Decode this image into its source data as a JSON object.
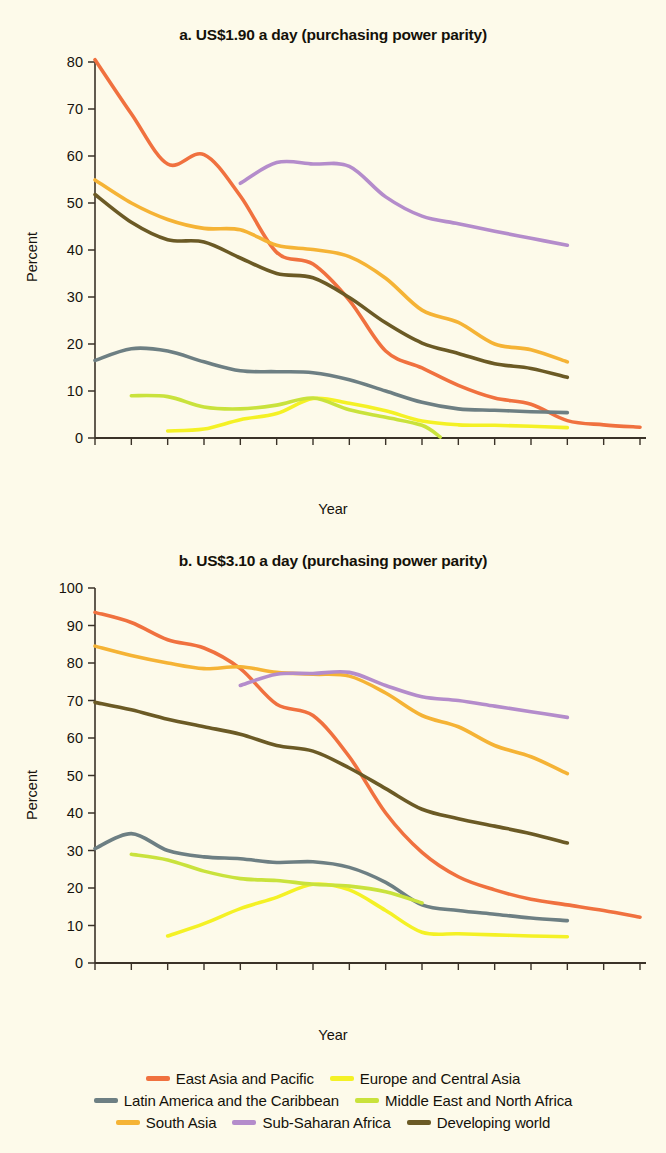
{
  "figure": {
    "background_color": "#fdfaea",
    "axis_color": "#3a3228",
    "xlabel": "Year",
    "ylabel": "Percent"
  },
  "legend": {
    "rows": [
      [
        {
          "label": "East Asia and Pacific",
          "color": "#f0713f"
        },
        {
          "label": "Europe and Central Asia",
          "color": "#f4f125"
        }
      ],
      [
        {
          "label": "Latin America and the Caribbean",
          "color": "#6d7f83"
        },
        {
          "label": "Middle East and North Africa",
          "color": "#c9e23c"
        }
      ],
      [
        {
          "label": "South Asia",
          "color": "#f5b335"
        },
        {
          "label": "Sub-Saharan Africa",
          "color": "#b48ccb"
        },
        {
          "label": "Developing world",
          "color": "#6b5a25"
        }
      ]
    ]
  },
  "chart_data": [
    {
      "id": "panel-a",
      "type": "line",
      "title": "a. US$1.90 a day (purchasing power parity)",
      "xlabel": "Year",
      "ylabel": "Percent",
      "ylim": [
        0,
        80
      ],
      "yticks": [
        0,
        10,
        20,
        30,
        40,
        50,
        60,
        70,
        80
      ],
      "grid": false,
      "legend_position": "below-figure",
      "categories": [
        "1981",
        "1984",
        "1987",
        "1990",
        "1993",
        "1996",
        "1999",
        "2002",
        "2005",
        "2008",
        "2010",
        "2011",
        "2012",
        "2013",
        "2014",
        "2015"
      ],
      "series": [
        {
          "name": "East Asia and Pacific",
          "color": "#f0713f",
          "x": [
            "1981",
            "1984",
            "1987",
            "1990",
            "1993",
            "1996",
            "1999",
            "2002",
            "2005",
            "2008",
            "2010",
            "2011",
            "2012",
            "2013",
            "2014",
            "2015"
          ],
          "values": [
            80.5,
            69.0,
            58.3,
            60.3,
            51.5,
            39.5,
            37.0,
            29.3,
            18.5,
            14.9,
            11.2,
            8.5,
            7.2,
            3.7,
            2.8,
            2.3
          ]
        },
        {
          "name": "Europe and Central Asia",
          "color": "#f4f125",
          "x": [
            "1987",
            "1990",
            "1993",
            "1996",
            "1999",
            "2002",
            "2005",
            "2008",
            "2010",
            "2011",
            "2012",
            "2013"
          ],
          "values": [
            1.5,
            1.9,
            3.9,
            5.2,
            8.4,
            7.4,
            5.8,
            3.6,
            2.8,
            2.7,
            2.5,
            2.2
          ]
        },
        {
          "name": "Latin America and the Caribbean",
          "color": "#6d7f83",
          "x": [
            "1981",
            "1984",
            "1987",
            "1990",
            "1993",
            "1996",
            "1999",
            "2002",
            "2005",
            "2008",
            "2010",
            "2011",
            "2012",
            "2013"
          ],
          "values": [
            16.5,
            19.0,
            18.5,
            16.2,
            14.3,
            14.1,
            13.9,
            12.4,
            10.0,
            7.6,
            6.2,
            5.9,
            5.6,
            5.4
          ]
        },
        {
          "name": "Middle East and North Africa",
          "color": "#c9e23c",
          "x": [
            "1984",
            "1987",
            "1990",
            "1993",
            "1996",
            "1999",
            "2002",
            "2005",
            "2008",
            "2009"
          ],
          "values": [
            9.0,
            8.8,
            6.6,
            6.2,
            7.0,
            8.5,
            6.0,
            4.4,
            2.7,
            0.2
          ]
        },
        {
          "name": "South Asia",
          "color": "#f5b335",
          "x": [
            "1981",
            "1984",
            "1987",
            "1990",
            "1993",
            "1996",
            "1999",
            "2002",
            "2005",
            "2008",
            "2010",
            "2011",
            "2012",
            "2013"
          ],
          "values": [
            54.9,
            50.0,
            46.5,
            44.6,
            44.3,
            41.0,
            40.1,
            38.6,
            34.0,
            27.2,
            24.6,
            20.0,
            18.8,
            16.2
          ]
        },
        {
          "name": "Sub-Saharan Africa",
          "color": "#b48ccb",
          "x": [
            "1993",
            "1996",
            "1999",
            "2002",
            "2005",
            "2008",
            "2010",
            "2011",
            "2012",
            "2013"
          ],
          "values": [
            54.2,
            58.6,
            58.3,
            57.8,
            51.3,
            47.2,
            45.6,
            44.0,
            42.5,
            41.0
          ]
        },
        {
          "name": "Developing world",
          "color": "#6b5a25",
          "x": [
            "1981",
            "1984",
            "1987",
            "1990",
            "1993",
            "1996",
            "1999",
            "2002",
            "2005",
            "2008",
            "2010",
            "2011",
            "2012",
            "2013"
          ],
          "values": [
            51.8,
            45.9,
            42.2,
            41.7,
            38.3,
            35.0,
            34.1,
            29.9,
            24.5,
            20.2,
            18.0,
            15.8,
            14.8,
            12.9
          ]
        }
      ]
    },
    {
      "id": "panel-b",
      "type": "line",
      "title": "b. US$3.10 a day (purchasing power parity)",
      "xlabel": "Year",
      "ylabel": "Percent",
      "ylim": [
        0,
        100
      ],
      "yticks": [
        0,
        10,
        20,
        30,
        40,
        50,
        60,
        70,
        80,
        90,
        100
      ],
      "grid": false,
      "legend_position": "below-figure",
      "categories": [
        "1981",
        "1984",
        "1987",
        "1990",
        "1993",
        "1996",
        "1999",
        "2002",
        "2005",
        "2008",
        "2010",
        "2011",
        "2012",
        "2013",
        "2014",
        "2015"
      ],
      "series": [
        {
          "name": "East Asia and Pacific",
          "color": "#f0713f",
          "x": [
            "1981",
            "1984",
            "1987",
            "1990",
            "1993",
            "1996",
            "1999",
            "2002",
            "2005",
            "2008",
            "2010",
            "2011",
            "2012",
            "2013",
            "2014",
            "2015"
          ],
          "values": [
            93.5,
            90.8,
            86.2,
            84.0,
            78.5,
            69.0,
            66.0,
            55.0,
            40.0,
            29.5,
            23.0,
            19.5,
            17.0,
            15.5,
            14.0,
            12.2
          ]
        },
        {
          "name": "Europe and Central Asia",
          "color": "#f4f125",
          "x": [
            "1987",
            "1990",
            "1993",
            "1996",
            "1999",
            "2002",
            "2005",
            "2008",
            "2010",
            "2011",
            "2012",
            "2013"
          ],
          "values": [
            7.2,
            10.5,
            14.5,
            17.5,
            21.0,
            19.5,
            14.0,
            8.2,
            7.8,
            7.5,
            7.2,
            7.0
          ]
        },
        {
          "name": "Latin America and the Caribbean",
          "color": "#6d7f83",
          "x": [
            "1981",
            "1984",
            "1987",
            "1990",
            "1993",
            "1996",
            "1999",
            "2002",
            "2005",
            "2008",
            "2010",
            "2011",
            "2012",
            "2013"
          ],
          "values": [
            30.5,
            34.5,
            30.0,
            28.3,
            27.8,
            26.8,
            27.0,
            25.5,
            21.5,
            15.5,
            14.0,
            13.0,
            12.0,
            11.3
          ]
        },
        {
          "name": "Middle East and North Africa",
          "color": "#c9e23c",
          "x": [
            "1984",
            "1987",
            "1990",
            "1993",
            "1996",
            "1999",
            "2002",
            "2005",
            "2008"
          ],
          "values": [
            29.0,
            27.5,
            24.5,
            22.5,
            22.0,
            21.0,
            20.5,
            19.0,
            16.0
          ]
        },
        {
          "name": "South Asia",
          "color": "#f5b335",
          "x": [
            "1981",
            "1984",
            "1987",
            "1990",
            "1993",
            "1996",
            "1999",
            "2002",
            "2005",
            "2008",
            "2010",
            "2011",
            "2012",
            "2013"
          ],
          "values": [
            84.5,
            82.0,
            80.0,
            78.5,
            79.0,
            77.5,
            77.0,
            76.5,
            72.0,
            66.0,
            63.0,
            58.0,
            55.0,
            50.5
          ]
        },
        {
          "name": "Sub-Saharan Africa",
          "color": "#b48ccb",
          "x": [
            "1993",
            "1996",
            "1999",
            "2002",
            "2005",
            "2008",
            "2010",
            "2011",
            "2012",
            "2013"
          ],
          "values": [
            74.0,
            77.0,
            77.2,
            77.5,
            74.0,
            71.0,
            70.0,
            68.5,
            67.0,
            65.5
          ]
        },
        {
          "name": "Developing world",
          "color": "#6b5a25",
          "x": [
            "1981",
            "1984",
            "1987",
            "1990",
            "1993",
            "1996",
            "1999",
            "2002",
            "2005",
            "2008",
            "2010",
            "2011",
            "2012",
            "2013"
          ],
          "values": [
            69.5,
            67.5,
            65.0,
            63.0,
            61.0,
            58.0,
            56.5,
            52.0,
            46.5,
            41.0,
            38.5,
            36.5,
            34.5,
            32.0
          ]
        }
      ]
    }
  ]
}
